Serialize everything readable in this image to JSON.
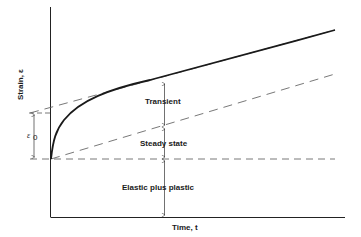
{
  "diagram": {
    "axes": {
      "y_label": "Strain, ε",
      "x_label": "Time, t"
    },
    "annotations": {
      "epsilon0": "ε",
      "epsilon0_sub": "0",
      "regions": [
        {
          "label": "Transient"
        },
        {
          "label": "Steady state"
        },
        {
          "label": "Elastic plus plastic"
        }
      ]
    },
    "colors": {
      "line": "#1a1a1a",
      "dashed": "#555555",
      "background": "#ffffff"
    }
  }
}
